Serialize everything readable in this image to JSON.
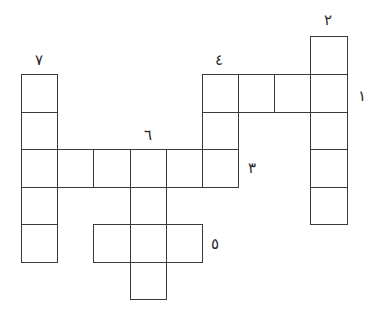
{
  "puzzle": {
    "type": "crossword",
    "numbering_script": "Eastern Arabic numerals",
    "line_color": "#3a3a3a",
    "background": "#ffffff",
    "clues": [
      {
        "id": 1,
        "label": "١",
        "direction": "horizontal",
        "length": 4,
        "x": 362,
        "y": 96
      },
      {
        "id": 2,
        "label": "٢",
        "direction": "vertical",
        "length": 5,
        "x": 328,
        "y": 20
      },
      {
        "id": 3,
        "label": "٣",
        "direction": "horizontal",
        "length": 6,
        "x": 252,
        "y": 168
      },
      {
        "id": 4,
        "label": "٤",
        "direction": "vertical",
        "length": 3,
        "x": 219,
        "y": 60
      },
      {
        "id": 5,
        "label": "٥",
        "direction": "horizontal",
        "length": 3,
        "x": 215,
        "y": 244
      },
      {
        "id": 6,
        "label": "٦",
        "direction": "vertical",
        "length": 4,
        "x": 148,
        "y": 135
      },
      {
        "id": 7,
        "label": "٧",
        "direction": "vertical",
        "length": 5,
        "x": 39,
        "y": 60
      }
    ],
    "cells": [
      {
        "x": 310,
        "y": 36,
        "w": 37,
        "h": 38
      },
      {
        "x": 202,
        "y": 74,
        "w": 36,
        "h": 38
      },
      {
        "x": 238,
        "y": 74,
        "w": 36,
        "h": 38
      },
      {
        "x": 274,
        "y": 74,
        "w": 36,
        "h": 38
      },
      {
        "x": 310,
        "y": 74,
        "w": 37,
        "h": 38
      },
      {
        "x": 21,
        "y": 74,
        "w": 36,
        "h": 38
      },
      {
        "x": 21,
        "y": 112,
        "w": 36,
        "h": 37
      },
      {
        "x": 202,
        "y": 112,
        "w": 36,
        "h": 37
      },
      {
        "x": 310,
        "y": 112,
        "w": 37,
        "h": 37
      },
      {
        "x": 21,
        "y": 149,
        "w": 36,
        "h": 38
      },
      {
        "x": 57,
        "y": 149,
        "w": 36,
        "h": 38
      },
      {
        "x": 93,
        "y": 149,
        "w": 37,
        "h": 38
      },
      {
        "x": 130,
        "y": 149,
        "w": 36,
        "h": 38
      },
      {
        "x": 166,
        "y": 149,
        "w": 36,
        "h": 38
      },
      {
        "x": 202,
        "y": 149,
        "w": 36,
        "h": 38
      },
      {
        "x": 310,
        "y": 149,
        "w": 37,
        "h": 38
      },
      {
        "x": 21,
        "y": 187,
        "w": 36,
        "h": 37
      },
      {
        "x": 130,
        "y": 187,
        "w": 36,
        "h": 37
      },
      {
        "x": 310,
        "y": 187,
        "w": 37,
        "h": 37
      },
      {
        "x": 21,
        "y": 224,
        "w": 36,
        "h": 38
      },
      {
        "x": 93,
        "y": 224,
        "w": 37,
        "h": 38
      },
      {
        "x": 130,
        "y": 224,
        "w": 36,
        "h": 38
      },
      {
        "x": 166,
        "y": 224,
        "w": 36,
        "h": 38
      },
      {
        "x": 130,
        "y": 262,
        "w": 36,
        "h": 37
      }
    ]
  }
}
